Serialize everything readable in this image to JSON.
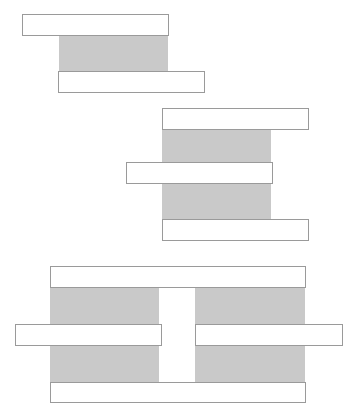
{
  "diagram": {
    "colors": {
      "fill": "#c9c9c9",
      "bar": "#ffffff",
      "border": "#9a9a9a"
    },
    "groups": [
      {
        "name": "group-1",
        "grays": [
          {
            "x": 59,
            "y": 35,
            "w": 109,
            "h": 37
          }
        ],
        "bars": [
          {
            "x": 22,
            "y": 14,
            "w": 147,
            "h": 22
          },
          {
            "x": 58,
            "y": 71,
            "w": 147,
            "h": 22
          }
        ]
      },
      {
        "name": "group-2",
        "grays": [
          {
            "x": 162,
            "y": 128,
            "w": 109,
            "h": 92
          }
        ],
        "bars": [
          {
            "x": 162,
            "y": 108,
            "w": 147,
            "h": 22
          },
          {
            "x": 126,
            "y": 162,
            "w": 147,
            "h": 22
          },
          {
            "x": 162,
            "y": 219,
            "w": 147,
            "h": 22
          }
        ]
      },
      {
        "name": "group-3",
        "grays": [
          {
            "x": 50,
            "y": 286,
            "w": 109,
            "h": 97
          },
          {
            "x": 195,
            "y": 286,
            "w": 110,
            "h": 97
          }
        ],
        "bars": [
          {
            "x": 50,
            "y": 266,
            "w": 256,
            "h": 22
          },
          {
            "x": 15,
            "y": 324,
            "w": 147,
            "h": 22
          },
          {
            "x": 195,
            "y": 324,
            "w": 148,
            "h": 22
          },
          {
            "x": 50,
            "y": 382,
            "w": 256,
            "h": 21
          }
        ]
      }
    ]
  }
}
